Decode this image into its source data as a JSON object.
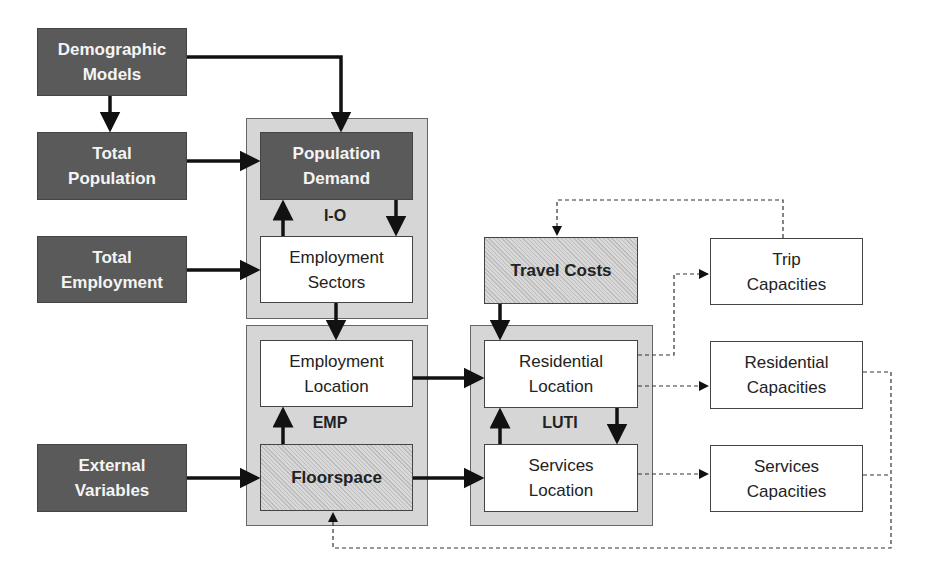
{
  "groups": {
    "io": {
      "label": "I-O"
    },
    "emp": {
      "label": "EMP"
    },
    "luti": {
      "label": "LUTI"
    }
  },
  "boxes": {
    "demographic_models": "Demographic\nModels",
    "total_population": "Total\nPopulation",
    "total_employment": "Total\nEmployment",
    "external_variables": "External\nVariables",
    "population_demand": "Population\nDemand",
    "employment_sectors": "Employment\nSectors",
    "employment_location": "Employment\nLocation",
    "floorspace": "Floorspace",
    "travel_costs": "Travel Costs",
    "residential_location": "Residential\nLocation",
    "services_location": "Services\nLocation",
    "trip_capacities": "Trip\nCapacities",
    "residential_capacities": "Residential\nCapacities",
    "services_capacities": "Services\nCapacities"
  },
  "colors": {
    "dark_box": "#5a5a5a",
    "group_bg": "#d6d6d6",
    "line": "#111111"
  }
}
